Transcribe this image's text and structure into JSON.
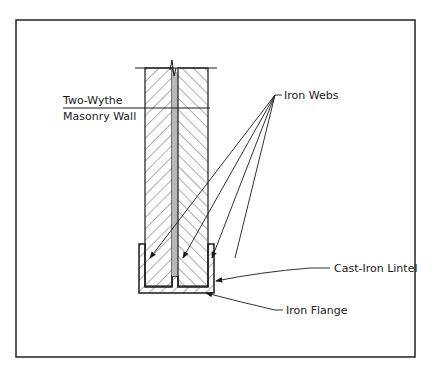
{
  "diagram": {
    "type": "architectural section detail",
    "labels": {
      "wall": [
        "Two-Wythe",
        "Masonry Wall"
      ],
      "webs": "Iron Webs",
      "lintel": "Cast-Iron Lintel",
      "flange": "Iron Flange"
    },
    "colors": {
      "line": "#1a1a1a",
      "cavity": "#b8b8b8",
      "background": "#ffffff"
    }
  }
}
